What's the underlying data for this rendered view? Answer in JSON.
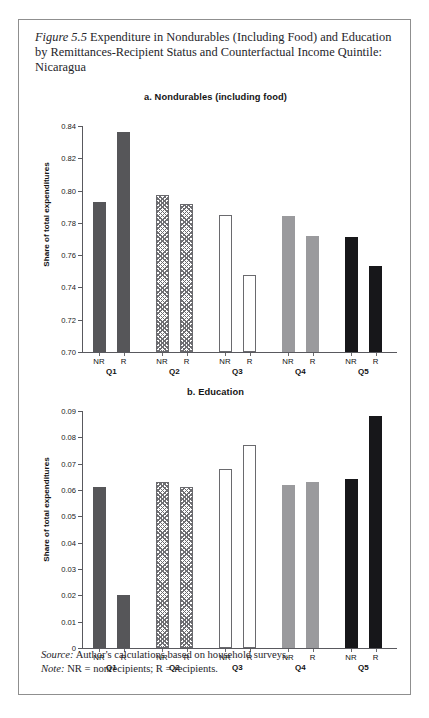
{
  "caption": {
    "figure_label": "Figure 5.5",
    "text": " Expenditure in Nondurables (Including Food) and Education by Remittances-Recipient Status and Counterfactual Income Quintile: Nicaragua"
  },
  "footer": {
    "source_label": "Source:",
    "source_text": " Author's calculations based on household surveys.",
    "note_label": "Note:",
    "note_text": " NR = nonrecipients; R = recipients."
  },
  "chart_data": [
    {
      "type": "bar",
      "id": "panel-a",
      "title": "a. Nondurables (including food)",
      "xlabel": "",
      "ylabel": "Share of total expenditures",
      "ylim": [
        0.7,
        0.84
      ],
      "yticks": [
        "0.70",
        "0.72",
        "0.74",
        "0.76",
        "0.78",
        "0.80",
        "0.82",
        "0.84"
      ],
      "ytick_values": [
        0.7,
        0.72,
        0.74,
        0.76,
        0.78,
        0.8,
        0.82,
        0.84
      ],
      "grid": false,
      "legend": "none",
      "groups": [
        "Q1",
        "Q2",
        "Q3",
        "Q4",
        "Q5"
      ],
      "categories": [
        "NR",
        "R",
        "NR",
        "R",
        "NR",
        "R",
        "NR",
        "R",
        "NR",
        "R"
      ],
      "values": [
        0.793,
        0.836,
        0.797,
        0.792,
        0.785,
        0.748,
        0.784,
        0.772,
        0.771,
        0.753
      ],
      "fills": [
        "solid-dark",
        "solid-dark",
        "hatch",
        "hatch",
        "white",
        "white",
        "gray",
        "gray",
        "black",
        "black"
      ]
    },
    {
      "type": "bar",
      "id": "panel-b",
      "title": "b. Education",
      "xlabel": "",
      "ylabel": "Share of total expenditures",
      "ylim": [
        0,
        0.09
      ],
      "yticks": [
        "0",
        "0.01",
        "0.02",
        "0.03",
        "0.04",
        "0.05",
        "0.06",
        "0.07",
        "0.08",
        "0.09"
      ],
      "ytick_values": [
        0,
        0.01,
        0.02,
        0.03,
        0.04,
        0.05,
        0.06,
        0.07,
        0.08,
        0.09
      ],
      "grid": false,
      "legend": "none",
      "groups": [
        "Q1",
        "Q2",
        "Q3",
        "Q4",
        "Q5"
      ],
      "categories": [
        "NR",
        "R",
        "NR",
        "R",
        "NR",
        "R",
        "NR",
        "R",
        "NR",
        "R"
      ],
      "values": [
        0.061,
        0.02,
        0.063,
        0.061,
        0.068,
        0.077,
        0.062,
        0.063,
        0.064,
        0.088
      ],
      "fills": [
        "solid-dark",
        "solid-dark",
        "hatch",
        "hatch",
        "white",
        "white",
        "gray",
        "gray",
        "black",
        "black"
      ]
    }
  ]
}
